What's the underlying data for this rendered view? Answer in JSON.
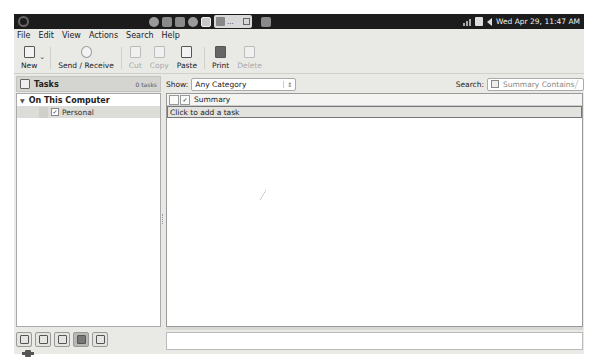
{
  "top_panel": {
    "clock": "Wed Apr 29, 11:47 AM",
    "tray_icons": [
      "firefox-icon",
      "files-icon",
      "terminal-icon",
      "help-icon",
      "evolution-icon"
    ],
    "task_button_label": "..."
  },
  "menubar": {
    "items": [
      "File",
      "Edit",
      "View",
      "Actions",
      "Search",
      "Help"
    ]
  },
  "toolbar": {
    "new_label": "New",
    "send_receive_label": "Send / Receive",
    "cut_label": "Cut",
    "copy_label": "Copy",
    "paste_label": "Paste",
    "print_label": "Print",
    "delete_label": "Delete"
  },
  "sidebar": {
    "title": "Tasks",
    "count": "0 tasks",
    "group": "On This Computer",
    "items": [
      {
        "label": "Personal",
        "checked": true
      }
    ]
  },
  "filter": {
    "show_label": "Show:",
    "category_value": "Any Category",
    "search_label": "Search:",
    "search_placeholder": "Summary Contains"
  },
  "table": {
    "columns": [
      "Summary"
    ],
    "add_prompt": "Click to add a task",
    "rows": []
  },
  "switcher": {
    "buttons": [
      "mail",
      "contacts",
      "calendars",
      "tasks",
      "memos"
    ],
    "active": "tasks"
  }
}
